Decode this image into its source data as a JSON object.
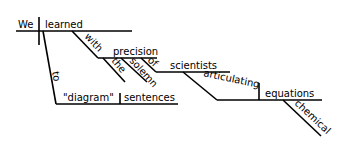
{
  "diagram": {
    "type": "sentence-diagram",
    "sentence": "We learned to \"diagram\" sentences with the precision of solemn scientists articulating chemical equations",
    "subject": "We",
    "verb": "learned",
    "infinitive": {
      "marker": "to",
      "verb": "\"diagram\"",
      "object": "sentences"
    },
    "prepositional_phrase": {
      "preposition": "with",
      "object": "precision",
      "modifiers": [
        "the",
        "solemn"
      ],
      "sub_phrase": {
        "preposition": "of",
        "object": "scientists",
        "participle": {
          "verb": "articulating",
          "object": "equations",
          "modifier": "chemical"
        }
      }
    },
    "line_color": "#000000"
  }
}
